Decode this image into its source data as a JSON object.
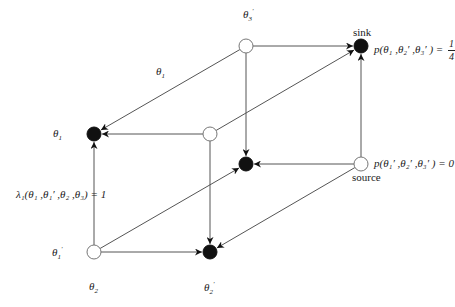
{
  "diagram": {
    "type": "cube-graph",
    "nodes": [
      {
        "id": "top-back-left",
        "x": 246,
        "y": 46,
        "fill": "open"
      },
      {
        "id": "sink",
        "x": 361,
        "y": 46,
        "fill": "filled"
      },
      {
        "id": "top-front-left",
        "x": 94,
        "y": 134,
        "fill": "filled"
      },
      {
        "id": "top-front-right",
        "x": 210,
        "y": 134,
        "fill": "open"
      },
      {
        "id": "bottom-back-left",
        "x": 246,
        "y": 164,
        "fill": "filled"
      },
      {
        "id": "source",
        "x": 361,
        "y": 164,
        "fill": "open"
      },
      {
        "id": "bottom-front-left",
        "x": 94,
        "y": 252,
        "fill": "open"
      },
      {
        "id": "bottom-front-right",
        "x": 210,
        "y": 252,
        "fill": "filled"
      }
    ],
    "edges": [
      {
        "from": "top-back-left",
        "to": "sink"
      },
      {
        "from": "top-back-left",
        "to": "top-front-left"
      },
      {
        "from": "top-back-left",
        "to": "bottom-back-left"
      },
      {
        "from": "top-front-right",
        "to": "top-front-left"
      },
      {
        "from": "top-front-right",
        "to": "sink"
      },
      {
        "from": "top-front-right",
        "to": "bottom-front-right"
      },
      {
        "from": "source",
        "to": "sink"
      },
      {
        "from": "source",
        "to": "bottom-back-left"
      },
      {
        "from": "source",
        "to": "bottom-front-right"
      },
      {
        "from": "bottom-front-left",
        "to": "top-front-left"
      },
      {
        "from": "bottom-front-left",
        "to": "bottom-front-right"
      },
      {
        "from": "bottom-front-left",
        "to": "bottom-back-left"
      }
    ],
    "colors": {
      "line": "#555555",
      "node_fill": "#111111",
      "node_open": "#ffffff"
    }
  },
  "labels": {
    "theta3_prime_top": {
      "base": "θ",
      "sub": "3",
      "sup": "′"
    },
    "theta1_diag": {
      "base": "θ",
      "sub": "1"
    },
    "theta1_left": {
      "base": "θ",
      "sub": "1"
    },
    "theta1_prime_left": {
      "base": "θ",
      "sub": "1",
      "sup": "′"
    },
    "theta2_bottom": {
      "base": "θ",
      "sub": "2"
    },
    "theta2_prime_bottom": {
      "base": "θ",
      "sub": "2",
      "sup": "′"
    },
    "sink_label": "sink",
    "source_label": "source",
    "sink_prob": {
      "prefix": "p(θ₁ ,θ₂′ ,θ₃′ ) =",
      "numerator": "1",
      "denominator": "4"
    },
    "source_prob": "p(θ₁′ ,θ₂′ ,θ₃′ ) = 0",
    "lambda_label": "λ₁(θ₁ ,θ₁′ ,θ₂ ,θ₃) = 1"
  }
}
